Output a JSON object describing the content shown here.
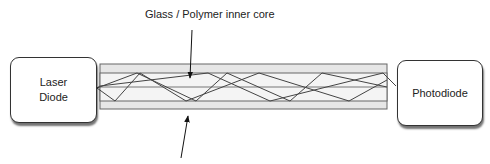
{
  "diagram": {
    "title_label": "Glass / Polymer inner core",
    "bottom_label": "",
    "source": {
      "line1": "Laser",
      "line2": "Diode"
    },
    "detector": {
      "label": "Photodiode"
    },
    "colors": {
      "cladding_fill": "#e6e6e6",
      "core_fill": "#f4f4f4",
      "line": "#555555",
      "ray": "#444444",
      "box_border": "#333333"
    }
  }
}
